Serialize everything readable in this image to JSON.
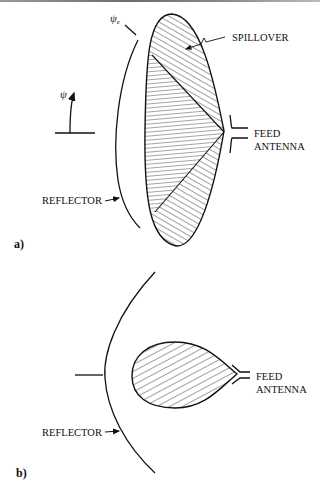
{
  "figure": {
    "panel_a": {
      "panel_label": "a)",
      "angle_label": "ψ",
      "edge_angle_label": "ψ",
      "edge_angle_subscript": "e",
      "spillover_label": "SPILLOVER",
      "feed_label_line1": "FEED",
      "feed_label_line2": "ANTENNA",
      "reflector_label": "REFLECTOR"
    },
    "panel_b": {
      "panel_label": "b)",
      "feed_label_line1": "FEED",
      "feed_label_line2": "ANTENNA",
      "reflector_label": "REFLECTOR"
    },
    "colors": {
      "ink": "#111111",
      "background": "#ffffff"
    }
  }
}
